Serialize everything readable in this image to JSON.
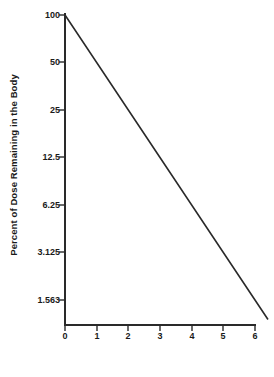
{
  "chart_data": {
    "type": "line",
    "title": "",
    "xlabel": "Half-lives",
    "ylabel": "Percent of Dose Remaining in the Body",
    "x": [
      0,
      1,
      2,
      3,
      4,
      5,
      6
    ],
    "values": [
      100,
      50,
      25,
      12.5,
      6.25,
      3.125,
      1.563
    ],
    "series": [
      {
        "name": "Percent of dose remaining",
        "x": [
          0,
          1,
          2,
          3,
          4,
          5,
          6
        ],
        "values": [
          100,
          50,
          25,
          12.5,
          6.25,
          3.125,
          1.563
        ]
      }
    ],
    "xlim": [
      0,
      6
    ],
    "ylim": [
      1.563,
      100
    ],
    "yscale": "log2",
    "grid": false,
    "legend": false,
    "legend_position": "none",
    "line_color": "#2a2a2a",
    "axis_color": "#2a2a2a",
    "background_color": "#ffffff",
    "x_ticks": [
      "0",
      "1",
      "2",
      "3",
      "4",
      "5",
      "6"
    ],
    "y_ticks": [
      "100",
      "50",
      "25",
      "12.5",
      "6.25",
      "3.125",
      "1.563"
    ],
    "annotations": []
  },
  "axes": {
    "y_title": "Percent of Dose Remaining in the Body",
    "x_title": "Half-lives",
    "y_tick_labels": [
      "100",
      "50",
      "25",
      "12.5",
      "6.25",
      "3.125",
      "1.563"
    ],
    "x_tick_labels": [
      "0",
      "1",
      "2",
      "3",
      "4",
      "5",
      "6"
    ]
  }
}
